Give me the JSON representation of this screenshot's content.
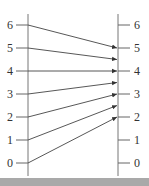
{
  "title": "",
  "left_axis": {
    "ticks": [
      "0",
      "1",
      "2",
      "3",
      "4",
      "5",
      "6"
    ]
  },
  "right_axis": {
    "ticks": [
      "0",
      "1",
      "2",
      "3",
      "4",
      "5",
      "6"
    ]
  },
  "mapping": [
    {
      "from": 0,
      "to": 2
    },
    {
      "from": 1,
      "to": 2.5
    },
    {
      "from": 2,
      "to": 3
    },
    {
      "from": 3,
      "to": 3.5
    },
    {
      "from": 4,
      "to": 4
    },
    {
      "from": 5,
      "to": 4.5
    },
    {
      "from": 6,
      "to": 5
    }
  ],
  "colors": {
    "line": "#444444",
    "axis": "#777777",
    "footer": "#a9a9a9"
  }
}
